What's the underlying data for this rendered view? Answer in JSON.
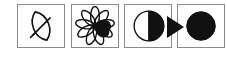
{
  "figure": {
    "background_color": "#ffffff",
    "stroke_color": "#000000",
    "fill_color": "#000000",
    "border_color": "#8a8a8a",
    "panel_count": 4,
    "width": 227,
    "height": 63
  },
  "panels": [
    {
      "index": 1,
      "id": "panel-1",
      "icon": "leaf-icon",
      "label": "leaf",
      "description": "Outlined pointed-oval leaf tilted diagonally with a midrib line",
      "fill": "none",
      "x": 17,
      "y": 4,
      "width": 48,
      "height": 44
    },
    {
      "index": 2,
      "id": "panel-2",
      "icon": "flower-icon",
      "label": "flower",
      "description": "Radial flower with nine outlined petals and one solid black petal pointing right",
      "petal_count": 9,
      "filled_petal_count": 1,
      "fill": "partial",
      "x": 71,
      "y": 4,
      "width": 48,
      "height": 44
    },
    {
      "index": 3,
      "id": "panel-3",
      "icon": "half-filled-circle-icon",
      "label": "half-shaded circle",
      "description": "Circle with left half white outlined and right half solid black, overflowing the panel border",
      "fill": "half",
      "x": 124,
      "y": 4,
      "width": 48,
      "height": 44
    },
    {
      "index": 4,
      "id": "panel-4",
      "icon": "filled-circle-icon",
      "label": "solid circle",
      "description": "Completely solid black circle",
      "fill": "solid",
      "x": 177,
      "y": 4,
      "width": 48,
      "height": 44
    }
  ],
  "connector": {
    "icon": "right-triangle-arrow-icon",
    "label": "arrow",
    "direction": "right",
    "color": "#000000",
    "from_panel": 3,
    "to_panel": 4,
    "x": 166,
    "y": 17,
    "width": 18,
    "height": 20
  }
}
